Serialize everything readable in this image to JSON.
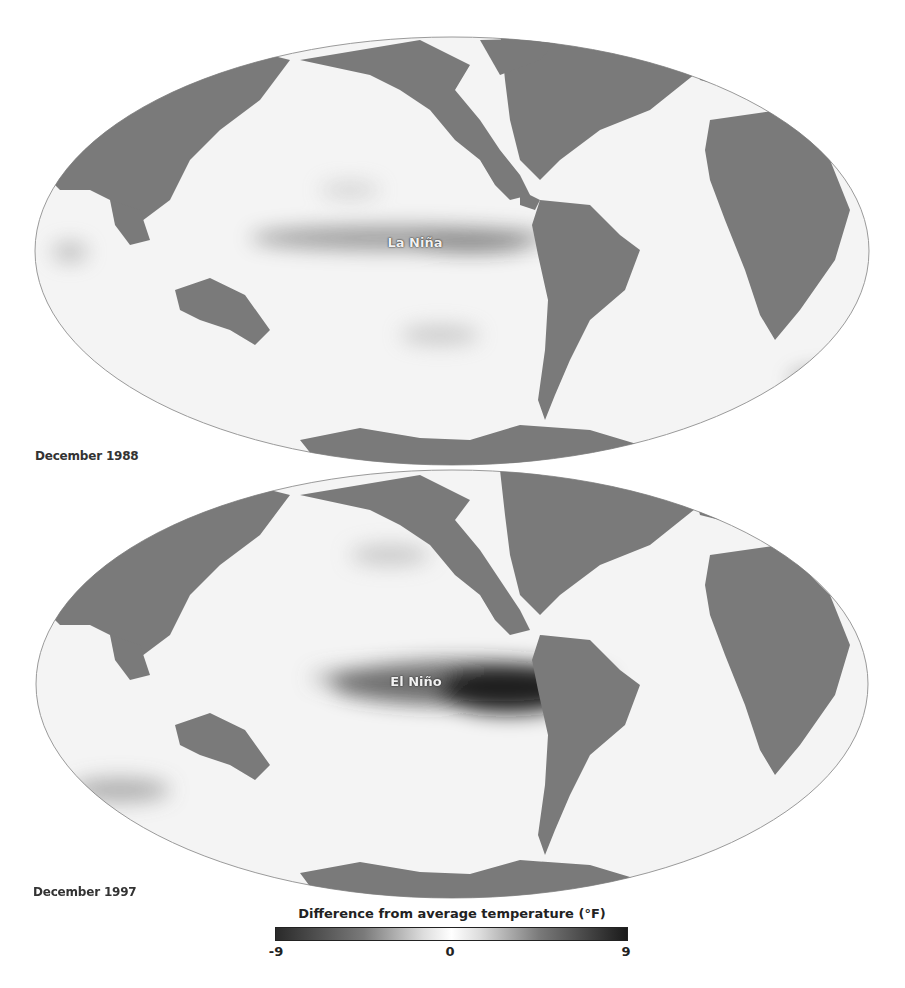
{
  "figure": {
    "panels": [
      {
        "date_label": "December 1988",
        "event_label": "La Niña",
        "ellipse": {
          "cx": 452,
          "cy": 251,
          "rx": 417,
          "ry": 214
        }
      },
      {
        "date_label": "December 1997",
        "event_label": "El Niño",
        "ellipse": {
          "cx": 452,
          "cy": 684,
          "rx": 416,
          "ry": 214
        }
      }
    ],
    "legend": {
      "title": "Difference from average temperature (°F)",
      "min_label": "-9",
      "mid_label": "0",
      "max_label": "9",
      "range": [
        -9,
        9
      ],
      "colors": {
        "low": "#2a2a2a",
        "mid": "#ffffff",
        "high": "#1a1a1a"
      }
    },
    "colors": {
      "land": "#7a7a7a",
      "ocean": "#f4f4f4",
      "outline": "#9a9a9a"
    }
  }
}
